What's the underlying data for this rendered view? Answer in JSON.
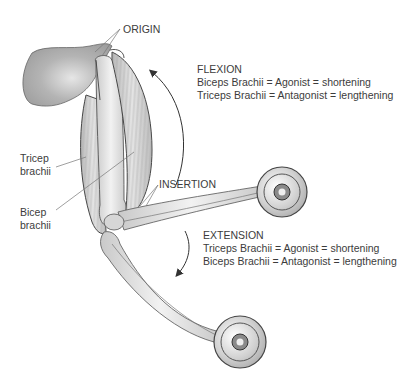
{
  "labels": {
    "origin": "ORIGIN",
    "insertion": "INSERTION",
    "tricep_line1": "Tricep",
    "tricep_line2": "brachii",
    "bicep_line1": "Bicep",
    "bicep_line2": "brachii"
  },
  "flexion": {
    "title": "FLEXION",
    "line1": "Biceps Brachii = Agonist = shortening",
    "line2": "Triceps Brachii = Antagonist = lengthening"
  },
  "extension": {
    "title": "EXTENSION",
    "line1": "Triceps Brachii = Agonist = shortening",
    "line2": "Biceps Brachii = Antagonist = lengthening"
  },
  "colors": {
    "shoulder": "#a9a9a9",
    "muscle": "#cfcfcf",
    "bone": "#dcdcdc",
    "outline": "#4a4a4a"
  }
}
